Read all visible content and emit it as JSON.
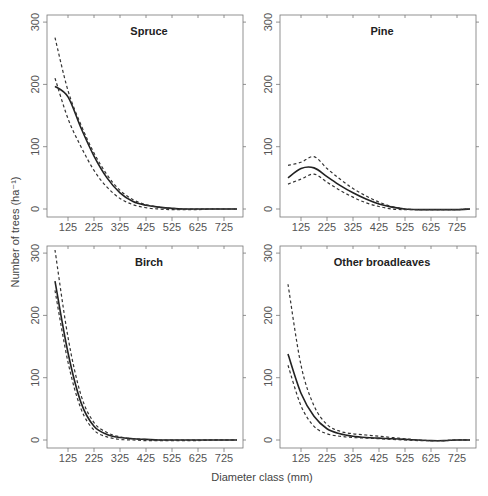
{
  "chart_data": {
    "type": "line",
    "xlabel": "Diameter class (mm)",
    "ylabel": "Number of trees (ha⁻¹)",
    "x_ticks": [
      125,
      225,
      325,
      425,
      525,
      625,
      725
    ],
    "y_ticks": [
      0,
      100,
      200,
      300
    ],
    "ylim": [
      0,
      300
    ],
    "xlim": [
      75,
      775
    ],
    "grid": false,
    "legend": null,
    "x": [
      75,
      125,
      175,
      225,
      275,
      325,
      375,
      425,
      475,
      525,
      575,
      625,
      675,
      725,
      775
    ],
    "panels": [
      {
        "title": "Spruce",
        "series": [
          {
            "name": "estimate",
            "style": "solid",
            "values": [
              197,
              180,
              130,
              85,
              50,
              26,
              12,
              6,
              3,
              1,
              0,
              0,
              0,
              0,
              0
            ]
          },
          {
            "name": "upper bound",
            "style": "dashed",
            "values": [
              275,
              190,
              135,
              90,
              55,
              30,
              15,
              7,
              3,
              1,
              0,
              0,
              0,
              0,
              0
            ]
          },
          {
            "name": "lower bound",
            "style": "dashed",
            "values": [
              210,
              145,
              100,
              62,
              35,
              17,
              7,
              2,
              0,
              -1,
              -1,
              -1,
              0,
              0,
              0
            ]
          }
        ]
      },
      {
        "title": "Pine",
        "series": [
          {
            "name": "estimate",
            "style": "solid",
            "values": [
              50,
              65,
              66,
              52,
              38,
              26,
              16,
              8,
              3,
              0,
              -1,
              -1,
              -1,
              -1,
              0
            ]
          },
          {
            "name": "upper bound",
            "style": "dashed",
            "values": [
              70,
              75,
              84,
              65,
              48,
              33,
              21,
              11,
              4,
              0,
              -1,
              -1,
              -1,
              -1,
              0
            ]
          },
          {
            "name": "lower bound",
            "style": "dashed",
            "values": [
              40,
              48,
              56,
              43,
              30,
              19,
              10,
              4,
              0,
              -1,
              -1,
              -1,
              -1,
              -1,
              0
            ]
          }
        ]
      },
      {
        "title": "Birch",
        "series": [
          {
            "name": "estimate",
            "style": "solid",
            "values": [
              255,
              140,
              60,
              22,
              9,
              4,
              2,
              1,
              0,
              0,
              0,
              0,
              0,
              0,
              0
            ]
          },
          {
            "name": "upper bound",
            "style": "dashed",
            "values": [
              305,
              165,
              72,
              28,
              12,
              5,
              2,
              1,
              0,
              0,
              0,
              0,
              0,
              0,
              0
            ]
          },
          {
            "name": "lower bound",
            "style": "dashed",
            "values": [
              240,
              125,
              50,
              16,
              5,
              1,
              0,
              -1,
              -1,
              -1,
              -1,
              -1,
              0,
              0,
              0
            ]
          }
        ]
      },
      {
        "title": "Other broadleaves",
        "series": [
          {
            "name": "estimate",
            "style": "solid",
            "values": [
              138,
              75,
              38,
              18,
              10,
              6,
              4,
              3,
              2,
              1,
              0,
              -1,
              -1,
              0,
              0
            ]
          },
          {
            "name": "upper bound",
            "style": "dashed",
            "values": [
              250,
              120,
              55,
              25,
              14,
              10,
              8,
              6,
              4,
              2,
              0,
              -1,
              -1,
              0,
              0
            ]
          },
          {
            "name": "lower bound",
            "style": "dashed",
            "values": [
              120,
              55,
              22,
              10,
              6,
              4,
              3,
              2,
              1,
              0,
              -1,
              -1,
              -1,
              0,
              0
            ]
          }
        ]
      }
    ]
  }
}
